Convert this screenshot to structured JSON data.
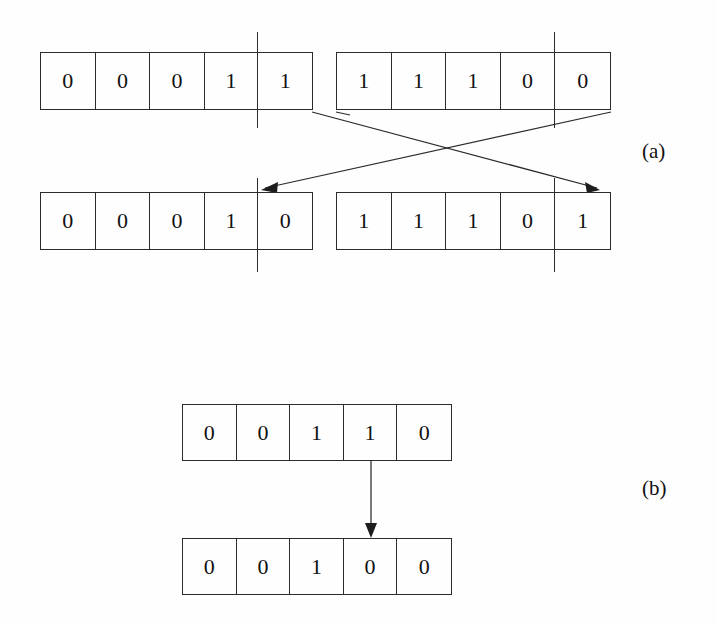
{
  "figure": {
    "background_color": "#fefefe",
    "ink_color": "#2b2b2b"
  },
  "parts": {
    "a": {
      "label": "(a)",
      "operator_name": "single-point crossover",
      "parents": [
        {
          "name": "parent-1",
          "bits": [
            "0",
            "0",
            "0",
            "1",
            "1"
          ],
          "crossover_after_gene_index": 3
        },
        {
          "name": "parent-2",
          "bits": [
            "1",
            "1",
            "1",
            "0",
            "0"
          ],
          "crossover_after_gene_index": 3
        }
      ],
      "offspring": [
        {
          "name": "offspring-1",
          "bits": [
            "0",
            "0",
            "0",
            "1",
            "0"
          ],
          "crossover_after_gene_index": 3
        },
        {
          "name": "offspring-2",
          "bits": [
            "1",
            "1",
            "1",
            "0",
            "1"
          ],
          "crossover_after_gene_index": 3
        }
      ]
    },
    "b": {
      "label": "(b)",
      "operator_name": "mutation",
      "before": {
        "name": "pre-mutation",
        "bits": [
          "0",
          "0",
          "1",
          "1",
          "0"
        ],
        "mutated_gene_index": 3
      },
      "after": {
        "name": "post-mutation",
        "bits": [
          "0",
          "0",
          "1",
          "0",
          "0"
        ],
        "mutated_gene_index": 3
      }
    }
  },
  "geometry": {
    "row1_top": 52,
    "row1_bottom": 110,
    "row2_top": 192,
    "row2_bottom": 250,
    "left_array_x": 40,
    "left_array_right": 313,
    "right_array_x": 336,
    "right_array_right": 611,
    "cut_left_x": 257,
    "cut_right_x": 554,
    "b_array_x": 182,
    "b_array_right": 452,
    "b_top_y": 404,
    "b_top_bottom": 460,
    "b_bottom_y": 538,
    "b_bottom_bottom": 595,
    "b_arrow_x": 371
  }
}
